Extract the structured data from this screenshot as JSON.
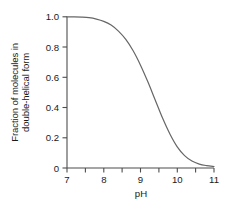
{
  "chart_data": {
    "type": "line",
    "title": "",
    "subtitle": "",
    "xlabel": "pH",
    "ylabel": "Fraction of molecules in double-helical form",
    "ylabel_line1": "Fraction of molecules in",
    "ylabel_line2": "double-helical form",
    "xlim": [
      7,
      11
    ],
    "ylim": [
      0,
      1.0
    ],
    "grid": false,
    "legend": null,
    "legend_position": "none",
    "xticks": [
      7,
      8,
      9,
      10,
      11
    ],
    "xtick_labels": [
      "7",
      "8",
      "9",
      "10",
      "11"
    ],
    "x_minor_ticks": [
      7.5,
      8.5,
      9.5,
      10.5
    ],
    "yticks": [
      0,
      0.2,
      0.4,
      0.6,
      0.8,
      1.0
    ],
    "ytick_labels": [
      "0",
      "0.2",
      "0.4",
      "0.6",
      "0.8",
      "1.0"
    ],
    "line_color": "#666666",
    "axis_color": "#4d4d4d",
    "background_color": "#ffffff",
    "series": [
      {
        "name": "denaturation curve",
        "x": [
          7.0,
          7.2,
          7.4,
          7.6,
          7.8,
          8.0,
          8.2,
          8.4,
          8.6,
          8.8,
          9.0,
          9.2,
          9.4,
          9.6,
          9.8,
          10.0,
          10.2,
          10.4,
          10.6,
          10.8,
          11.0
        ],
        "values": [
          1.0,
          1.0,
          0.998,
          0.994,
          0.985,
          0.97,
          0.945,
          0.905,
          0.85,
          0.775,
          0.68,
          0.57,
          0.45,
          0.33,
          0.225,
          0.14,
          0.082,
          0.046,
          0.026,
          0.016,
          0.01
        ]
      }
    ]
  }
}
